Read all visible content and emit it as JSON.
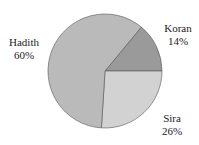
{
  "chart_data": {
    "type": "pie",
    "title": "",
    "categories": [
      "Koran",
      "Sira",
      "Hadith"
    ],
    "values": [
      14,
      26,
      60
    ],
    "labels": [
      "14%",
      "26%",
      "60%"
    ],
    "colors": [
      "#9a9a9a",
      "#d2d2d2",
      "#bababa"
    ],
    "legend": "none (direct labels)"
  },
  "labels": {
    "koran": {
      "name": "Koran",
      "pct": "14%"
    },
    "sira": {
      "name": "Sira",
      "pct": "26%"
    },
    "hadith": {
      "name": "Hadith",
      "pct": "60%"
    }
  }
}
